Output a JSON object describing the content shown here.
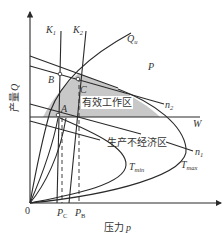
{
  "diagram": {
    "axes": {
      "x_label": "压力",
      "x_symbol": "p",
      "y_label": "产量",
      "y_symbol": "Q",
      "origin": "0"
    },
    "x_ticks": [
      {
        "main": "P",
        "sub": "C"
      },
      {
        "main": "P",
        "sub": "B"
      }
    ],
    "curves": {
      "K1": {
        "main": "K",
        "sub": "1"
      },
      "K2": {
        "main": "K",
        "sub": "2"
      },
      "Qu": {
        "main": "Q",
        "sub": "u"
      },
      "n2": {
        "main": "n",
        "sub": "2"
      },
      "n1": {
        "main": "n",
        "sub": "1"
      },
      "W": {
        "main": "W"
      },
      "Tmin": {
        "main": "T",
        "sub": "min"
      },
      "Tmax": {
        "main": "T",
        "sub": "max"
      }
    },
    "points": [
      "A",
      "B",
      "C"
    ],
    "regions": {
      "effective": "有效工作区",
      "uneconomic": "生产不经济区",
      "P": "P"
    },
    "colors": {
      "effective_fill": "#c8c8c8",
      "line": "#2a2a2a"
    }
  }
}
